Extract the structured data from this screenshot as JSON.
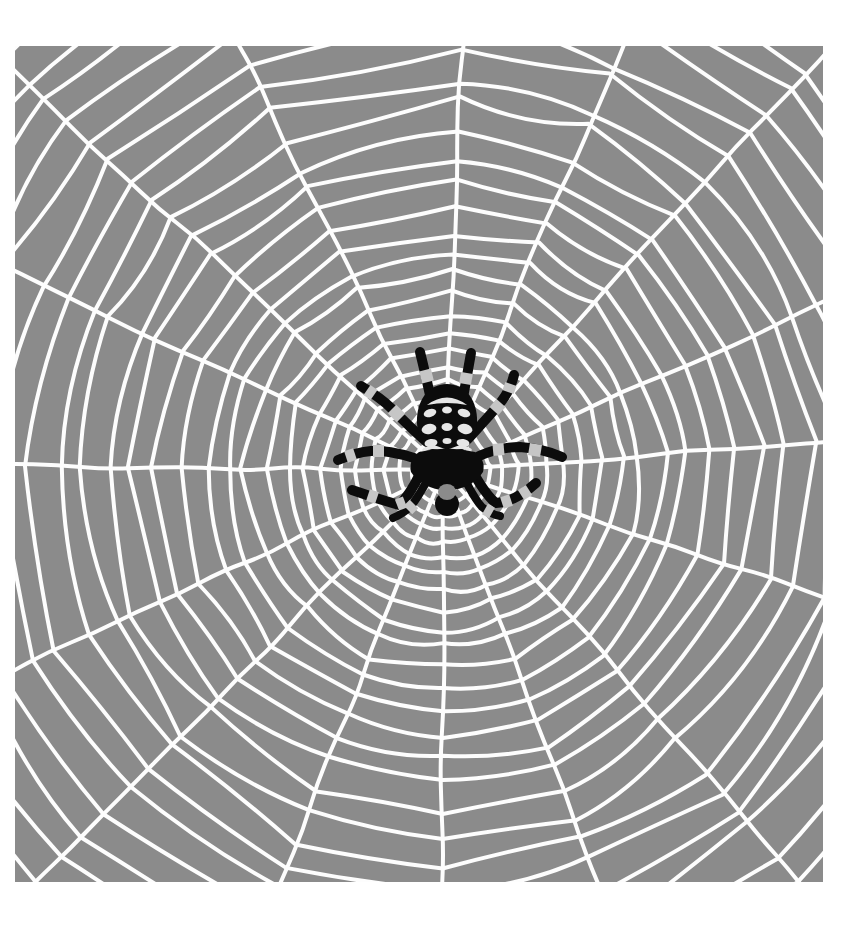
{
  "colors": {
    "page_background": "#ffffff",
    "panel_gray": "#8b8b8b",
    "web_white": "#fdfdfd",
    "spider_black": "#0c0c0c",
    "leg_band_gray": "#c6c6c6",
    "abdomen_mark": "#e6e6e6"
  },
  "web": {
    "center_x": 429,
    "center_y": 424,
    "spoke_count": 16,
    "spoke_length": 680,
    "ring_count": 30,
    "inner_radius": 10,
    "first_gap": 11,
    "gap_increment": 0.85,
    "max_ring_radius": 660,
    "stroke_width": 4,
    "seed": 7
  },
  "spider": {
    "legs_per_side": 4,
    "banded_legs": true,
    "pose": "hanging-head-down-at-web-hub"
  }
}
